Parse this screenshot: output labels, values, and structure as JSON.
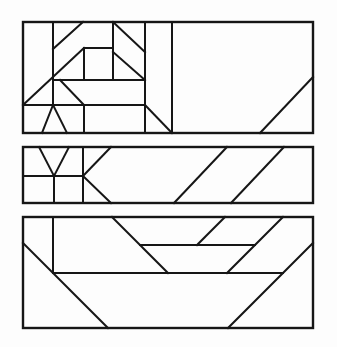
{
  "canvas": {
    "width": 337,
    "height": 347,
    "viewbox": "0 0 337 347",
    "background": "#fdfdfd",
    "stroke_color": "#161616",
    "segment_stroke_width": 2,
    "border_stroke_width": 2.4
  },
  "drawing": {
    "title": "abstract-geometric-line-composition",
    "panel_count": 3
  },
  "panels": [
    {
      "name": "top-panel",
      "rect": {
        "x": 23,
        "y": 22,
        "w": 290,
        "h": 111
      },
      "segments": [
        [
          53,
          22,
          53,
          105
        ],
        [
          113,
          22,
          113,
          80
        ],
        [
          145,
          22,
          145,
          133
        ],
        [
          172,
          22,
          172,
          133
        ],
        [
          84,
          48,
          84,
          80
        ],
        [
          84,
          105,
          84,
          133
        ],
        [
          84,
          48,
          113,
          48
        ],
        [
          53,
          80,
          145,
          80
        ],
        [
          23,
          105,
          145,
          105
        ],
        [
          53,
          49,
          83,
          22
        ],
        [
          113,
          22,
          145,
          52
        ],
        [
          113,
          52,
          145,
          80
        ],
        [
          23,
          105,
          84,
          48
        ],
        [
          60,
          80,
          84,
          105
        ],
        [
          53,
          105,
          42,
          133
        ],
        [
          53,
          105,
          67,
          133
        ],
        [
          145,
          105,
          172,
          133
        ],
        [
          260,
          133,
          313,
          77
        ]
      ]
    },
    {
      "name": "middle-panel",
      "rect": {
        "x": 23,
        "y": 147,
        "w": 290,
        "h": 56
      },
      "segments": [
        [
          23,
          176,
          83,
          176
        ],
        [
          83,
          147,
          83,
          203
        ],
        [
          39,
          147,
          54,
          176
        ],
        [
          69,
          147,
          54,
          176
        ],
        [
          54,
          176,
          54,
          203
        ],
        [
          111,
          147,
          83,
          176
        ],
        [
          83,
          176,
          111,
          203
        ],
        [
          174,
          203,
          227,
          147
        ],
        [
          231,
          203,
          284,
          147
        ]
      ]
    },
    {
      "name": "bottom-panel",
      "rect": {
        "x": 23,
        "y": 217,
        "w": 290,
        "h": 111
      },
      "segments": [
        [
          53,
          217,
          53,
          273
        ],
        [
          53,
          273,
          283,
          273
        ],
        [
          140,
          245,
          255,
          245
        ],
        [
          23,
          243,
          108,
          328
        ],
        [
          112,
          217,
          168,
          273
        ],
        [
          197,
          245,
          225,
          217
        ],
        [
          227,
          273,
          283,
          217
        ],
        [
          228,
          328,
          313,
          243
        ]
      ]
    }
  ]
}
